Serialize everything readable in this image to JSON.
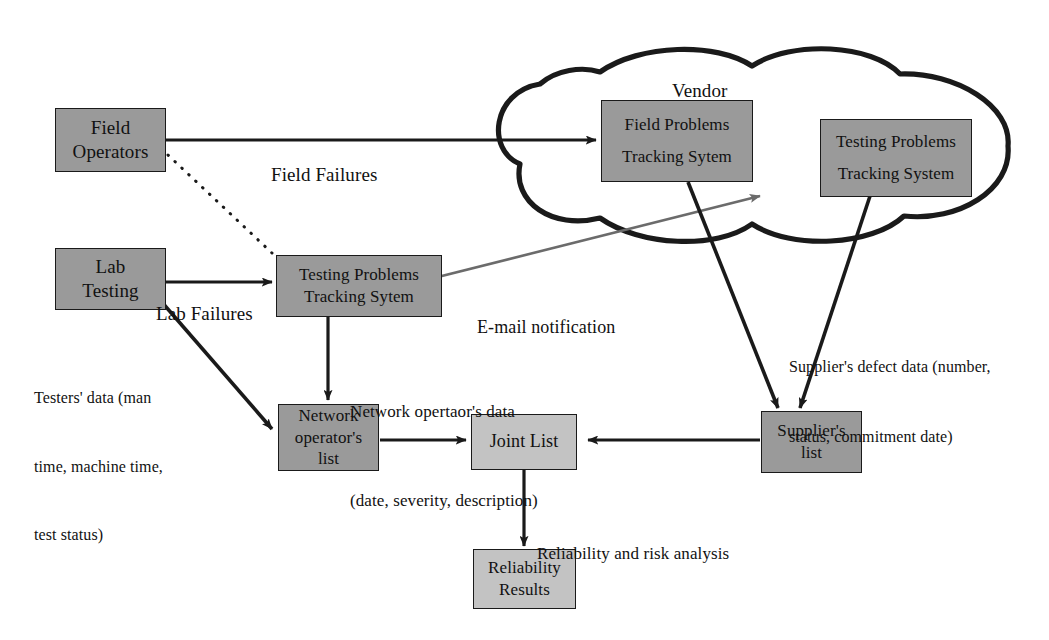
{
  "diagram": {
    "title_label": "Vendor",
    "nodes": {
      "field_operators": {
        "lines": [
          "Field",
          "Operators"
        ]
      },
      "lab_testing": {
        "lines": [
          "Lab",
          "Testing"
        ]
      },
      "testing_problems_local": {
        "lines": [
          "Testing Problems",
          "Tracking Sytem"
        ]
      },
      "field_problems_vendor": {
        "lines": [
          "Field Problems",
          "Tracking Sytem"
        ]
      },
      "testing_problems_vendor": {
        "lines": [
          "Testing Problems",
          "Tracking System"
        ]
      },
      "network_operator_list": {
        "lines": [
          "Network",
          "operator's",
          "list"
        ]
      },
      "joint_list": {
        "lines": [
          "Joint List"
        ]
      },
      "suppliers_list": {
        "lines": [
          "Supplier's",
          "list"
        ]
      },
      "reliability_results": {
        "lines": [
          "Reliability",
          "Results"
        ]
      }
    },
    "edge_labels": {
      "field_failures": [
        "Field Failures"
      ],
      "lab_failures": [
        "Lab Failures"
      ],
      "email_notification": [
        "E-mail notification"
      ],
      "testers_data": [
        "Testers' data (man",
        "time, machine time,",
        "test status)"
      ],
      "network_operator_data": [
        "Network opertaor's data",
        "(date, severity, description)"
      ],
      "suppliers_defect_data": [
        "Supplier's defect data (number,",
        "status, commitment date)"
      ],
      "reliability_risk_analysis": [
        "Reliability and risk analysis"
      ]
    },
    "colors": {
      "node_dark": "#9a9a9a",
      "node_light": "#c3c3c3",
      "stroke": "#1a1a1a",
      "email_arrow": "#6b6b6b",
      "background": "#ffffff"
    }
  }
}
